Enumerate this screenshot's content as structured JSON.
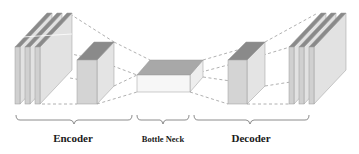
{
  "diagram": {
    "type": "autoencoder-architecture",
    "sections": [
      {
        "id": "encoder",
        "label": "Encoder"
      },
      {
        "id": "bottleneck",
        "label": "Bottle Neck"
      },
      {
        "id": "decoder",
        "label": "Decoder"
      }
    ],
    "colors": {
      "front_face": "#d4d4d4",
      "side_face": "#e2e2e2",
      "top_face": "#8a8a8a",
      "bottleneck_front": "#f7f7f7",
      "bottleneck_top": "#a8a8a8",
      "edge": "#9a9a9a",
      "dashed_connector": "#9c9c9c",
      "brace": "#6e6e6e",
      "text": "#1a1a1a"
    }
  }
}
